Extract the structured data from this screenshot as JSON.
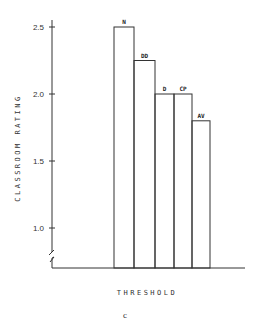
{
  "chart_data": {
    "type": "bar",
    "title": "",
    "xlabel": "THRESHOLD",
    "ylabel": "CLASSROOM RATING",
    "caption": "c",
    "categories": [
      "N",
      "DD",
      "D",
      "CP",
      "AV"
    ],
    "values": [
      2.5,
      2.25,
      2.0,
      2.0,
      1.8
    ],
    "ylim": [
      0.7,
      2.6
    ],
    "yticks": [
      1.0,
      1.5,
      2.0,
      2.5
    ],
    "ytick_labels": [
      "1.0",
      "1.5",
      "2.0",
      "2.5"
    ],
    "axis_break": true,
    "grid": false,
    "legend": "none"
  }
}
